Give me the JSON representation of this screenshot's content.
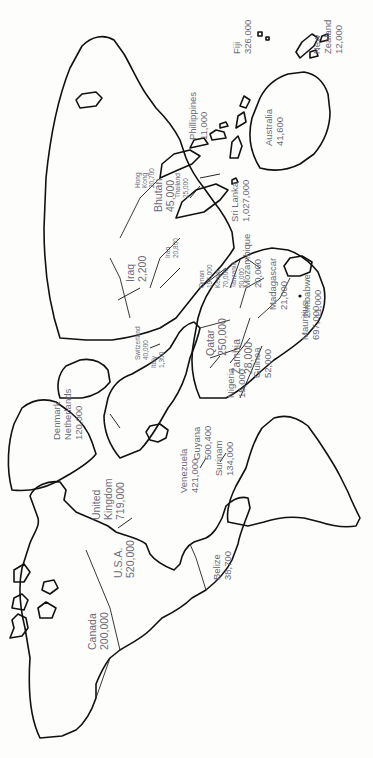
{
  "map": {
    "title": "",
    "orientation": "rotated 90 degrees counter-clockwise",
    "line_color": "#111111",
    "label_color": "#6b6b7a",
    "labels": [
      {
        "id": "canada",
        "name": "Canada",
        "value": "200,000"
      },
      {
        "id": "usa",
        "name": "U.S.A.",
        "value": "520,000"
      },
      {
        "id": "belize",
        "name": "Belize",
        "value": "38,700"
      },
      {
        "id": "venezuela",
        "name": "Venezuela",
        "value": "421,000"
      },
      {
        "id": "guyana",
        "name": "Guyana",
        "value": "500,400"
      },
      {
        "id": "surinam",
        "name": "Surinam",
        "value": "134,000"
      },
      {
        "id": "united-kingdom",
        "name": "United Kingdom",
        "value": "719,000"
      },
      {
        "id": "denmark-netherlands",
        "name": "Denmark Netherlands",
        "value": "120,000"
      },
      {
        "id": "guinea",
        "name": "Guinea",
        "value": "52,000"
      },
      {
        "id": "nigeria",
        "name": "Nigeria",
        "value": "15,000"
      },
      {
        "id": "switzerland",
        "name": "Switzerland",
        "value": "40,000"
      },
      {
        "id": "italy",
        "name": "Italy",
        "value": "1,300"
      },
      {
        "id": "qatar",
        "name": "Qatar",
        "value": "250,000"
      },
      {
        "id": "zambia",
        "name": "Zambia",
        "value": "28,000"
      },
      {
        "id": "zimbabwe",
        "name": "Zimbabwe",
        "value": "11,000"
      },
      {
        "id": "iraq",
        "name": "Iraq",
        "value": "2,200"
      },
      {
        "id": "iran",
        "name": "Iran",
        "value": "20,800"
      },
      {
        "id": "oman",
        "name": "Oman",
        "value": "197,000"
      },
      {
        "id": "kenya",
        "name": "Kenya",
        "value": "70,000"
      },
      {
        "id": "tanzania",
        "name": "Tanzania",
        "value": "50,000"
      },
      {
        "id": "mozambique",
        "name": "Mozambique",
        "value": "20,000"
      },
      {
        "id": "madagascar",
        "name": "Madagascar",
        "value": "21,000"
      },
      {
        "id": "mauritius",
        "name": "Mauritius",
        "value": "697,000"
      },
      {
        "id": "bhutan",
        "name": "Bhutan",
        "value": "45,000"
      },
      {
        "id": "sri-lanka",
        "name": "Sri Lanka",
        "value": "1,027,000"
      },
      {
        "id": "hong-kong",
        "name": "Hong Kong",
        "value": "20,700"
      },
      {
        "id": "thailand",
        "name": "Thailand",
        "value": "25,000"
      },
      {
        "id": "philippines",
        "name": "Phillippines",
        "value": "11,000"
      },
      {
        "id": "australia",
        "name": "Australia",
        "value": "41,600"
      },
      {
        "id": "fiji",
        "name": "Fiji",
        "value": "326,000"
      },
      {
        "id": "new-zealand",
        "name": "New Zealand",
        "value": "12,000"
      }
    ]
  }
}
